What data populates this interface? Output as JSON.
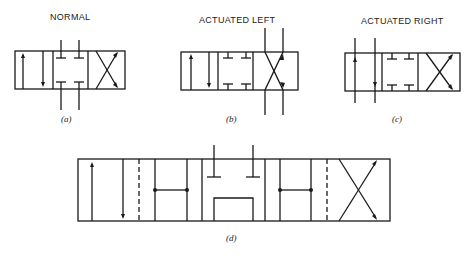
{
  "figure": {
    "panels": [
      {
        "id": "a",
        "title": "NORMAL",
        "caption": "(a)",
        "state": "center position, ports blocked"
      },
      {
        "id": "b",
        "title": "ACTUATED LEFT",
        "caption": "(b)",
        "state": "right envelope aligned with ports (crossed flow)"
      },
      {
        "id": "c",
        "title": "ACTUATED RIGHT",
        "caption": "(c)",
        "state": "left envelope aligned with ports (parallel flow)"
      },
      {
        "id": "d",
        "title": "",
        "caption": "(d)",
        "state": "five-envelope valve with dashed intermediate positions"
      }
    ]
  },
  "colors": {
    "line": "#1a1a1a",
    "background": "#ffffff"
  }
}
